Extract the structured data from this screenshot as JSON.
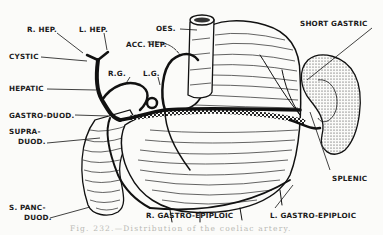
{
  "figure": {
    "caption": "Fig. 232.—Distribution of the coeliac artery.",
    "colors": {
      "ink": "#111111",
      "paper": "#fbfbf9",
      "caption": "#b9b9b4"
    }
  },
  "labels": {
    "r_hep": "R. HEP.",
    "l_hep": "L. HEP.",
    "cystic": "CYSTIC",
    "hepatic": "HEPATIC",
    "gastro_duod": "GASTRO-DUOD.",
    "supra_duod_1": "SUPRA-",
    "supra_duod_2": "DUOD.",
    "s_panc_duod_1": "S. PANC-",
    "s_panc_duod_2": "DUOD.",
    "r_g": "R.G.",
    "l_g": "L.G.",
    "acc_hep": "ACC. HEP.",
    "oes": "OES.",
    "short_gastric": "SHORT GASTRIC",
    "splenic": "SPLENIC",
    "r_gastro_epiploic": "R. GASTRO-EPIPLOIC",
    "l_gastro_epiploic": "L. GASTRO-EPIPLOIC"
  },
  "structures": [
    "stomach",
    "oesophagus",
    "duodenum",
    "spleen",
    "coeliac trunk"
  ]
}
